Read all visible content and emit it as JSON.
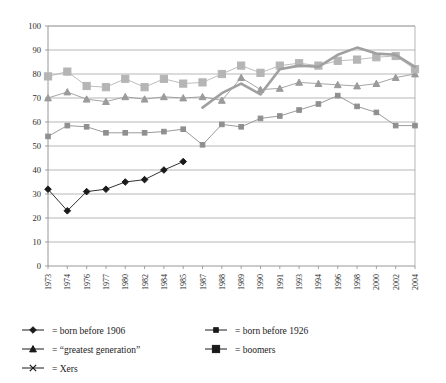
{
  "chart_data": {
    "type": "line",
    "title": "",
    "subtitle": "",
    "xlabel": "",
    "ylabel": "",
    "ylim": [
      0,
      100
    ],
    "ytick_step": 10,
    "yticks": [
      "0",
      "10",
      "20",
      "30",
      "40",
      "50",
      "60",
      "70",
      "80",
      "90",
      "100"
    ],
    "grid": true,
    "legend_position": "below",
    "categories": [
      "1973",
      "1974",
      "1976",
      "1977",
      "1980",
      "1982",
      "1984",
      "1985",
      "1987",
      "1988",
      "1989",
      "1990",
      "1991",
      "1993",
      "1994",
      "1996",
      "1998",
      "2000",
      "2002",
      "2004"
    ],
    "series": [
      {
        "name": "born before 1906",
        "legend_label": "= born before 1906",
        "marker": "diamond",
        "color": "#1a1a1a",
        "values": [
          32,
          23,
          31,
          32,
          35,
          36,
          40,
          43.5,
          null,
          null,
          null,
          null,
          null,
          null,
          null,
          null,
          null,
          null,
          null,
          null
        ]
      },
      {
        "name": "born before 1926",
        "legend_label": "= born before 1926",
        "marker": "small-square",
        "color": "#8f8f8f",
        "values": [
          54,
          58.5,
          58,
          55.5,
          55.5,
          55.5,
          56,
          57,
          50.5,
          59,
          58,
          61.5,
          62.5,
          65,
          67.5,
          71,
          66.5,
          64,
          58.5,
          58.5
        ]
      },
      {
        "name": "greatest generation",
        "legend_label": "= “greatest generation”",
        "marker": "triangle",
        "color": "#9b9b9b",
        "values": [
          70,
          72.5,
          69.5,
          68.5,
          70.5,
          69.5,
          70.5,
          70,
          70.5,
          69,
          78.5,
          73.5,
          74,
          76.5,
          76,
          75.5,
          75,
          76,
          78.5,
          80
        ]
      },
      {
        "name": "boomers",
        "legend_label": "= boomers",
        "marker": "square",
        "color": "#b5b5b5",
        "values": [
          79,
          81,
          75,
          74.5,
          78,
          74.5,
          78,
          76,
          76.5,
          80,
          83.5,
          80.5,
          83.5,
          84.5,
          83.5,
          85.5,
          86,
          87,
          87.5,
          82
        ]
      },
      {
        "name": "Xers",
        "legend_label": "= Xers",
        "marker": "x",
        "color": "#a0a0a0",
        "thick": true,
        "values": [
          null,
          null,
          null,
          null,
          null,
          null,
          null,
          null,
          66,
          72,
          76,
          71.5,
          82,
          83.5,
          83,
          88,
          91,
          88.5,
          88,
          83
        ]
      }
    ]
  },
  "legend": {
    "items": [
      {
        "id": "born-before-1906",
        "marker": "diamond",
        "label": "= born before 1906"
      },
      {
        "id": "born-before-1926",
        "marker": "small-square",
        "label": "= born before 1926"
      },
      {
        "id": "greatest-generation",
        "marker": "triangle",
        "label": "= “greatest generation”"
      },
      {
        "id": "boomers",
        "marker": "square",
        "label": "= boomers"
      },
      {
        "id": "xers",
        "marker": "x",
        "label": "= Xers"
      }
    ]
  }
}
